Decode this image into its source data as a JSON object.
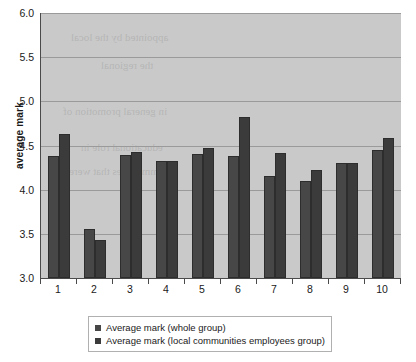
{
  "chart_data": {
    "type": "bar",
    "title": "",
    "xlabel": "",
    "ylabel": "average mark",
    "ylim": [
      3.0,
      6.0
    ],
    "ytick_labels": [
      "6.0",
      "5.5",
      "5.0",
      "4.5",
      "4.0",
      "3.5",
      "3.0"
    ],
    "ytick_values": [
      6.0,
      5.5,
      5.0,
      4.5,
      4.0,
      3.5,
      3.0
    ],
    "grid": true,
    "grid_axis": "y",
    "legend_position": "bottom",
    "categories": [
      "1",
      "2",
      "3",
      "4",
      "5",
      "6",
      "7",
      "8",
      "9",
      "10"
    ],
    "series": [
      {
        "name": "Average mark (whole group)",
        "color": "#474747",
        "values": [
          4.38,
          3.55,
          4.39,
          4.33,
          4.4,
          4.38,
          4.15,
          4.1,
          4.3,
          4.45
        ]
      },
      {
        "name": "Average mark (local communities employees group)",
        "color": "#3b3b3b",
        "values": [
          4.63,
          3.43,
          4.43,
          4.32,
          4.47,
          4.82,
          4.42,
          4.22,
          4.3,
          4.58
        ]
      }
    ],
    "plot_background_color": "#c9c9c9",
    "gridline_color": "#9a9a9a",
    "axis_color": "#4a4a4a"
  },
  "legend": {
    "entries": [
      "Average mark (whole group)",
      "Average mark (local communities employees group)"
    ]
  },
  "bleed_through_text": {
    "lines": [
      "appointed by the local",
      "the regional",
      "in general promotion of",
      "educational role in",
      "communities that were"
    ]
  }
}
